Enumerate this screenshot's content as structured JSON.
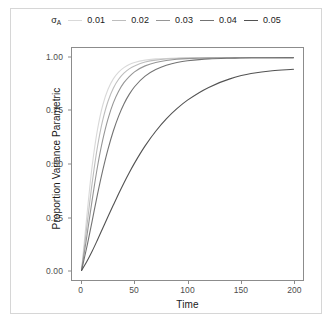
{
  "legend": {
    "title": "σ",
    "title_sub": "A",
    "position": "top",
    "entries": [
      {
        "label": "0.01",
        "color": "#d9d9d9"
      },
      {
        "label": "0.02",
        "color": "#bdbdbd"
      },
      {
        "label": "0.03",
        "color": "#969696"
      },
      {
        "label": "0.04",
        "color": "#737373"
      },
      {
        "label": "0.05",
        "color": "#525252"
      }
    ]
  },
  "axes": {
    "x_title": "Time",
    "y_title": "Proportion Variance Parametric",
    "x_ticks": [
      "0",
      "50",
      "100",
      "150",
      "200"
    ],
    "y_ticks": [
      "0.00",
      "0.25",
      "0.50",
      "0.75",
      "1.00"
    ]
  },
  "chart_data": {
    "type": "line",
    "title": "",
    "xlabel": "Time",
    "ylabel": "Proportion Variance Parametric",
    "xlim": [
      0,
      200
    ],
    "ylim": [
      0.0,
      1.0
    ],
    "xticks": [
      0,
      50,
      100,
      150,
      200
    ],
    "yticks": [
      0.0,
      0.25,
      0.5,
      0.75,
      1.0
    ],
    "grid": false,
    "legend_position": "top",
    "legend_title": "sigma_A",
    "x": [
      0,
      5,
      10,
      15,
      20,
      25,
      30,
      35,
      40,
      45,
      50,
      60,
      70,
      80,
      90,
      100,
      120,
      140,
      160,
      180,
      200
    ],
    "series": [
      {
        "name": "0.01",
        "color": "#d9d9d9",
        "values": [
          0.0,
          0.255,
          0.49,
          0.66,
          0.776,
          0.851,
          0.9,
          0.932,
          0.953,
          0.967,
          0.977,
          0.988,
          0.994,
          0.996,
          0.998,
          0.999,
          0.999,
          1.0,
          1.0,
          1.0,
          1.0
        ]
      },
      {
        "name": "0.02",
        "color": "#bdbdbd",
        "values": [
          0.0,
          0.205,
          0.41,
          0.58,
          0.706,
          0.795,
          0.856,
          0.898,
          0.927,
          0.947,
          0.961,
          0.979,
          0.988,
          0.993,
          0.996,
          0.998,
          0.999,
          0.999,
          1.0,
          1.0,
          1.0
        ]
      },
      {
        "name": "0.03",
        "color": "#969696",
        "values": [
          0.0,
          0.16,
          0.33,
          0.486,
          0.613,
          0.712,
          0.787,
          0.842,
          0.882,
          0.911,
          0.933,
          0.961,
          0.977,
          0.986,
          0.992,
          0.995,
          0.998,
          0.999,
          0.999,
          1.0,
          1.0
        ]
      },
      {
        "name": "0.04",
        "color": "#737373",
        "values": [
          0.0,
          0.11,
          0.232,
          0.356,
          0.47,
          0.57,
          0.655,
          0.725,
          0.782,
          0.827,
          0.863,
          0.913,
          0.944,
          0.964,
          0.977,
          0.985,
          0.994,
          0.997,
          0.999,
          0.999,
          1.0
        ]
      },
      {
        "name": "0.05",
        "color": "#525252",
        "values": [
          0.0,
          0.042,
          0.09,
          0.143,
          0.198,
          0.253,
          0.307,
          0.36,
          0.411,
          0.459,
          0.504,
          0.585,
          0.654,
          0.712,
          0.76,
          0.8,
          0.86,
          0.9,
          0.925,
          0.938,
          0.945
        ]
      }
    ]
  }
}
